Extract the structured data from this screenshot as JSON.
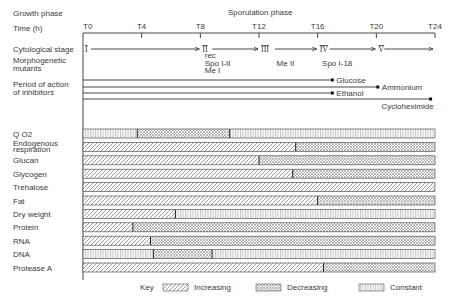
{
  "header": {
    "growth_phase_label": "Growth phase",
    "sporulation_phase_label": "Sporulation phase",
    "time_label": "Time (h)"
  },
  "time_axis": {
    "ticks": [
      {
        "label": "T0",
        "t": 0
      },
      {
        "label": "T4",
        "t": 4
      },
      {
        "label": "T8",
        "t": 8
      },
      {
        "label": "T12",
        "t": 12
      },
      {
        "label": "T16",
        "t": 16
      },
      {
        "label": "T20",
        "t": 20
      },
      {
        "label": "T24",
        "t": 24
      }
    ],
    "range": [
      0,
      24
    ]
  },
  "cytological": {
    "label": "Cytological stage",
    "stages": [
      {
        "label": "I",
        "t": 0
      },
      {
        "label": "II",
        "t": 8
      },
      {
        "label": "III",
        "t": 12
      },
      {
        "label": "IV",
        "t": 16
      },
      {
        "label": "V",
        "t": 20
      }
    ]
  },
  "mutants": {
    "label_line1": "Morphogenetic",
    "label_line2": "mutants",
    "groups": [
      {
        "lines": [
          "rec",
          "Spo I-II",
          "Me I"
        ],
        "t": 8.3
      },
      {
        "lines": [
          "Me II"
        ],
        "t": 13.2
      },
      {
        "lines": [
          "Spo I-18"
        ],
        "t": 16.3
      }
    ]
  },
  "inhibitors": {
    "label_line1": "Period of action",
    "label_line2": "of inhibitors",
    "items": [
      {
        "name": "Glucose",
        "end": 17.0
      },
      {
        "name": "Ammonium",
        "end": 20.1
      },
      {
        "name": "Ethanol",
        "end": 17.0
      },
      {
        "name": "Cycloheximide",
        "end": 23.7
      }
    ]
  },
  "chart_data": {
    "type": "timeline",
    "title": "",
    "x_axis": "Time (h)",
    "xlim": [
      0,
      24
    ],
    "rows": [
      {
        "name": "Q O2",
        "segments": [
          {
            "from": 0,
            "to": 3.7,
            "state": "constant"
          },
          {
            "from": 3.7,
            "to": 10,
            "state": "decreasing"
          },
          {
            "from": 10,
            "to": 24,
            "state": "constant"
          }
        ]
      },
      {
        "name": "Endogenous respiration",
        "segments": [
          {
            "from": 0,
            "to": 14.5,
            "state": "increasing"
          },
          {
            "from": 14.5,
            "to": 24,
            "state": "decreasing"
          }
        ]
      },
      {
        "name": "Glucan",
        "segments": [
          {
            "from": 0,
            "to": 12,
            "state": "increasing"
          },
          {
            "from": 12,
            "to": 24,
            "state": "decreasing"
          }
        ]
      },
      {
        "name": "Glycogen",
        "segments": [
          {
            "from": 0,
            "to": 14.3,
            "state": "increasing"
          },
          {
            "from": 14.3,
            "to": 24,
            "state": "decreasing"
          }
        ]
      },
      {
        "name": "Trehalose",
        "segments": [
          {
            "from": 0,
            "to": 24,
            "state": "increasing"
          }
        ]
      },
      {
        "name": "Fat",
        "segments": [
          {
            "from": 0,
            "to": 16,
            "state": "increasing"
          },
          {
            "from": 16,
            "to": 24,
            "state": "decreasing"
          }
        ]
      },
      {
        "name": "Dry weight",
        "segments": [
          {
            "from": 0,
            "to": 6.3,
            "state": "increasing"
          },
          {
            "from": 6.3,
            "to": 24,
            "state": "constant"
          }
        ]
      },
      {
        "name": "Protein",
        "segments": [
          {
            "from": 0,
            "to": 3.4,
            "state": "increasing"
          },
          {
            "from": 3.4,
            "to": 24,
            "state": "decreasing"
          }
        ]
      },
      {
        "name": "RNA",
        "segments": [
          {
            "from": 0,
            "to": 4.6,
            "state": "increasing"
          },
          {
            "from": 4.6,
            "to": 24,
            "state": "decreasing"
          }
        ]
      },
      {
        "name": "DNA",
        "segments": [
          {
            "from": 0,
            "to": 4.8,
            "state": "constant"
          },
          {
            "from": 4.8,
            "to": 8.8,
            "state": "decreasing"
          },
          {
            "from": 8.8,
            "to": 24,
            "state": "constant"
          }
        ]
      },
      {
        "name": "Protease A",
        "segments": [
          {
            "from": 0,
            "to": 16.4,
            "state": "increasing"
          },
          {
            "from": 16.4,
            "to": 24,
            "state": "decreasing"
          }
        ]
      }
    ],
    "legend": {
      "title": "Key",
      "placement": "bottom",
      "entries": [
        {
          "state": "increasing",
          "label": "Increasing"
        },
        {
          "state": "decreasing",
          "label": "Decreasing"
        },
        {
          "state": "constant",
          "label": "Constant"
        }
      ]
    }
  }
}
